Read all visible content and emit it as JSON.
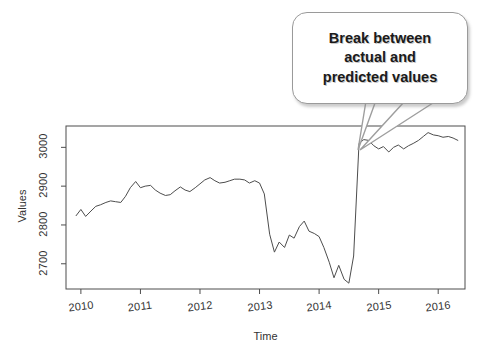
{
  "figure": {
    "background_color": "#ffffff",
    "line_color": "#4d4d4d",
    "frame_color": "#4d4d4d"
  },
  "annotation": {
    "name": "break-callout",
    "lines": [
      "Break between",
      "actual and",
      "predicted values"
    ],
    "full_text": "Break between actual and predicted values",
    "border_color": "#9a9a9a",
    "fill_color": "#ffffff",
    "text_color": "#1a1a1a",
    "points_at_year": 2014.83
  },
  "chart_data": {
    "type": "line",
    "title": "",
    "subtitle": "",
    "xlabel": "Time",
    "ylabel": "Values",
    "grid": false,
    "legend": "none",
    "xlim": [
      2009.75,
      2016.45
    ],
    "ylim": [
      2635,
      3055
    ],
    "xticks": [
      2010,
      2011,
      2012,
      2013,
      2014,
      2015,
      2016
    ],
    "xtick_labels": [
      "2010",
      "2011",
      "2012",
      "2013",
      "2014",
      "2015",
      "2016"
    ],
    "yticks": [
      2700,
      2800,
      2900,
      3000
    ],
    "ytick_labels": [
      "2700",
      "2800",
      "2900",
      "3000"
    ],
    "series": [
      {
        "name": "values",
        "color": "#4d4d4d",
        "x": [
          2009.92,
          2010.0,
          2010.08,
          2010.17,
          2010.25,
          2010.33,
          2010.42,
          2010.5,
          2010.58,
          2010.67,
          2010.75,
          2010.83,
          2010.92,
          2011.0,
          2011.08,
          2011.17,
          2011.25,
          2011.33,
          2011.42,
          2011.5,
          2011.58,
          2011.67,
          2011.75,
          2011.83,
          2011.92,
          2012.0,
          2012.08,
          2012.17,
          2012.25,
          2012.33,
          2012.42,
          2012.5,
          2012.58,
          2012.67,
          2012.75,
          2012.83,
          2012.92,
          2013.0,
          2013.08,
          2013.17,
          2013.25,
          2013.33,
          2013.42,
          2013.5,
          2013.58,
          2013.67,
          2013.75,
          2013.83,
          2013.92,
          2014.0,
          2014.08,
          2014.17,
          2014.25,
          2014.33,
          2014.42,
          2014.5,
          2014.58,
          2014.67,
          2014.75,
          2014.83,
          2014.92,
          2015.0,
          2015.08,
          2015.17,
          2015.25,
          2015.33,
          2015.42,
          2015.5,
          2015.58,
          2015.67,
          2015.75,
          2015.83,
          2015.92,
          2016.0,
          2016.08,
          2016.17,
          2016.25,
          2016.33
        ],
        "y": [
          2824,
          2840,
          2822,
          2836,
          2848,
          2852,
          2858,
          2862,
          2860,
          2858,
          2874,
          2896,
          2912,
          2896,
          2900,
          2902,
          2890,
          2882,
          2876,
          2878,
          2888,
          2898,
          2890,
          2886,
          2896,
          2906,
          2916,
          2922,
          2914,
          2908,
          2910,
          2914,
          2918,
          2918,
          2916,
          2908,
          2914,
          2908,
          2880,
          2776,
          2730,
          2756,
          2742,
          2774,
          2766,
          2796,
          2810,
          2784,
          2778,
          2770,
          2742,
          2704,
          2664,
          2696,
          2660,
          2650,
          2720,
          3010,
          3020,
          3018,
          3004,
          2996,
          3002,
          2988,
          3000,
          3006,
          2996,
          3004,
          3010,
          3018,
          3028,
          3038,
          3032,
          3030,
          3026,
          3028,
          3024,
          3018
        ]
      }
    ]
  }
}
